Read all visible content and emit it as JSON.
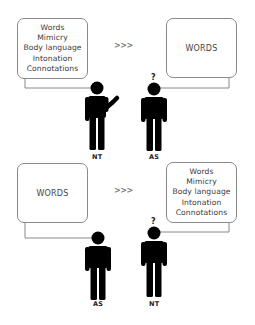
{
  "diagram": {
    "panels": [
      {
        "id": "top",
        "speaker_box": {
          "lines": [
            "Words",
            "Mimicry",
            "Body language",
            "Intonation",
            "Connotations"
          ]
        },
        "arrow": ">>>",
        "listener_box": {
          "lines": [
            "WORDS"
          ]
        },
        "speaker": {
          "label": "NT",
          "pose": "gesturing"
        },
        "listener": {
          "label": "AS",
          "question_mark": "?"
        }
      },
      {
        "id": "bottom",
        "speaker_box": {
          "lines": [
            "WORDS"
          ]
        },
        "arrow": ">>>",
        "listener_box": {
          "lines": [
            "Words",
            "Mimicry",
            "Body language",
            "Intonation",
            "Connotations"
          ]
        },
        "speaker": {
          "label": "AS",
          "pose": "standing"
        },
        "listener": {
          "label": "NT",
          "question_mark": "?"
        }
      }
    ],
    "colors": {
      "figure": "#000000",
      "box_border": "#8a8a8a",
      "connector": "#8a8a8a",
      "arrow": "#777777",
      "text": "#3a3a3a"
    }
  }
}
